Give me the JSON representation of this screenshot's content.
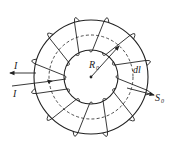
{
  "diagram": {
    "labels": {
      "current_out": "I",
      "current_in": "I",
      "radius": "R",
      "radius_sub": "0",
      "line_element": "dl",
      "area": "S",
      "area_sub": "0"
    },
    "geometry": {
      "center": [
        91,
        77
      ],
      "outer_radius": 57,
      "mean_radius_dashed": 42,
      "inner_radius": 27,
      "winding_count": 12
    },
    "colors": {
      "stroke": "#222222",
      "background": "#ffffff"
    }
  }
}
